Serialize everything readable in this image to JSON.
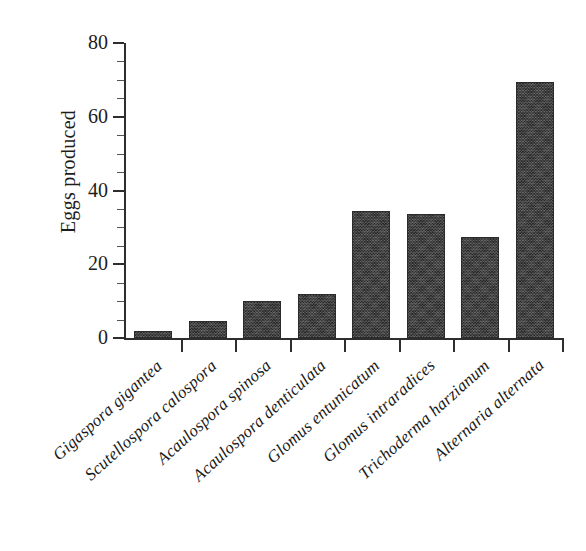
{
  "chart_data": {
    "type": "bar",
    "title": "",
    "xlabel": "",
    "ylabel": "Eggs produced",
    "ylim": [
      0,
      80
    ],
    "yticks": [
      0,
      20,
      40,
      60,
      80
    ],
    "ytick_labels": [
      "0",
      "20",
      "40",
      "60",
      "80"
    ],
    "grid": false,
    "legend": false,
    "bar_color": "#3b3b3b",
    "categories": [
      "Gigaspora gigantea",
      "Scutellospora calospora",
      "Acaulospora spinosa",
      "Acaulospora denticulata",
      "Glomus entunicatum",
      "Glomus intraradices",
      "Trichoderma harzianum",
      "Alternaria alternata"
    ],
    "values": [
      2,
      4.7,
      10,
      12,
      34.5,
      33.5,
      27.5,
      69.5
    ]
  }
}
